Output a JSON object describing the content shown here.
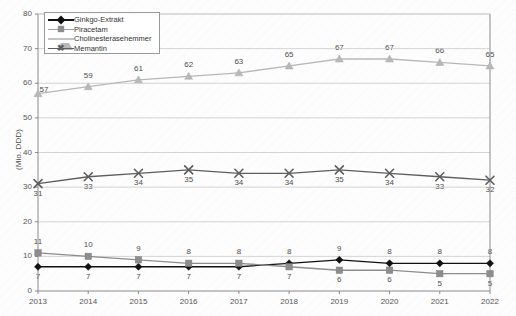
{
  "chart_data": {
    "type": "line",
    "title": "",
    "subtitle": "",
    "xlabel": "",
    "ylabel": "(Mio. DDD)",
    "categories": [
      "2013",
      "2014",
      "2015",
      "2016",
      "2017",
      "2018",
      "2019",
      "2020",
      "2021",
      "2022"
    ],
    "ylim": [
      0,
      80
    ],
    "ytick_step": 10,
    "yticks": [
      "0",
      "10",
      "20",
      "30",
      "40",
      "50",
      "60",
      "70",
      "80"
    ],
    "grid": true,
    "grid_axis": "y",
    "legend_position": "top-left",
    "series": [
      {
        "name": "Ginkgo-Extrakt",
        "marker": "diamond",
        "color": "#111111",
        "values": [
          7,
          7,
          7,
          7,
          7,
          8,
          9,
          8,
          8,
          8
        ],
        "labels": [
          "7",
          "7",
          "7",
          "7",
          "7",
          "8",
          "9",
          "8",
          "8",
          "8"
        ],
        "label_position": [
          "below",
          "below",
          "below",
          "below",
          "below",
          "above",
          "above",
          "above",
          "above",
          "above"
        ]
      },
      {
        "name": "Piracetam",
        "marker": "square",
        "color": "#8d8d8d",
        "values": [
          11,
          10,
          9,
          8,
          8,
          7,
          6,
          6,
          5,
          5
        ],
        "labels": [
          "11",
          "10",
          "9",
          "8",
          "8",
          "7",
          "6",
          "6",
          "5",
          "5"
        ],
        "label_position": [
          "above",
          "above",
          "above",
          "above",
          "above",
          "below",
          "below",
          "below",
          "below",
          "below"
        ]
      },
      {
        "name": "Cholinesterasehemmer",
        "marker": "triangle",
        "color": "#b8b8b8",
        "values": [
          57,
          59,
          61,
          62,
          63,
          65,
          67,
          67,
          66,
          65
        ],
        "labels": [
          "57",
          "59",
          "61",
          "62",
          "63",
          "65",
          "67",
          "67",
          "66",
          "65"
        ],
        "label_position": [
          "left",
          "above",
          "above",
          "above",
          "above",
          "above",
          "above",
          "above",
          "above",
          "above"
        ]
      },
      {
        "name": "Memantin",
        "marker": "x",
        "color": "#5d5d5d",
        "values": [
          31,
          33,
          34,
          35,
          34,
          34,
          35,
          34,
          33,
          32
        ],
        "labels": [
          "31",
          "33",
          "34",
          "35",
          "34",
          "34",
          "35",
          "34",
          "33",
          "32"
        ],
        "label_position": [
          "below",
          "below",
          "below",
          "below",
          "below",
          "below",
          "below",
          "below",
          "below",
          "below"
        ]
      }
    ]
  },
  "legend": {
    "items": [
      {
        "label": "Ginkgo-Extrakt",
        "marker": "diamond-marker",
        "color": "#111111"
      },
      {
        "label": "Piracetam",
        "marker": "square-marker",
        "color": "#8d8d8d"
      },
      {
        "label": "Cholinesterasehemmer",
        "marker": "triangle-marker",
        "color": "#b8b8b8"
      },
      {
        "label": "Memantin",
        "marker": "x-marker",
        "color": "#5d5d5d"
      }
    ]
  },
  "axes": {
    "y_title": "(Mio. DDD)"
  },
  "colors": {
    "axis": "#8a8a8a",
    "grid": "#c9c9c9",
    "text": "#555555",
    "background": "#fdfdfd"
  }
}
